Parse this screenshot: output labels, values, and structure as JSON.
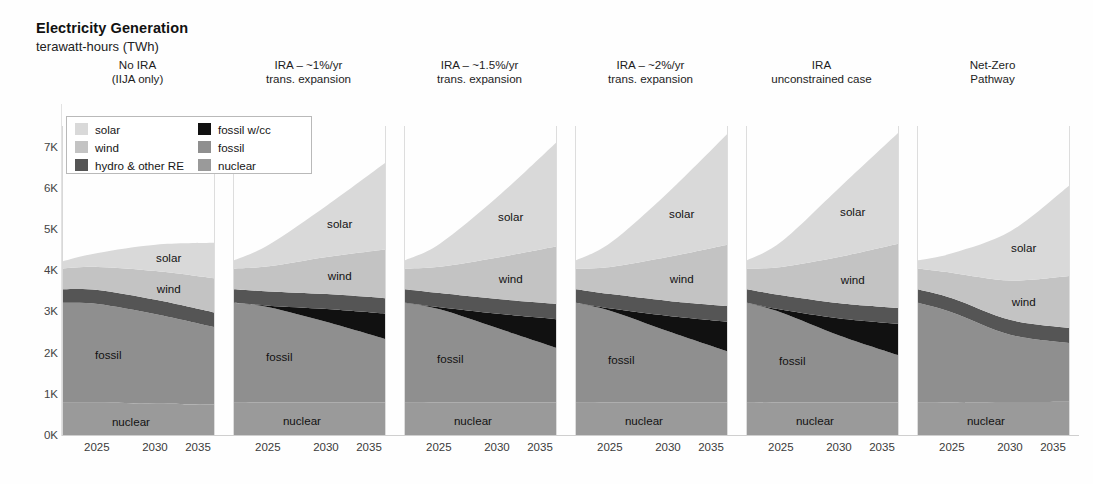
{
  "header": {
    "title": "Electricity Generation",
    "subtitle": "terawatt-hours (TWh)"
  },
  "legend": {
    "columns": [
      [
        {
          "label": "solar",
          "color": "#d9d9d9"
        },
        {
          "label": "wind",
          "color": "#c3c3c3"
        },
        {
          "label": "hydro & other RE",
          "color": "#555555"
        }
      ],
      [
        {
          "label": "fossil w/cc",
          "color": "#111111"
        },
        {
          "label": "fossil",
          "color": "#8f8f8f"
        },
        {
          "label": "nuclear",
          "color": "#9a9a9a"
        }
      ]
    ]
  },
  "axes": {
    "y_ticks": [
      "7K",
      "6K",
      "5K",
      "4K",
      "3K",
      "2K",
      "1K",
      "0K"
    ],
    "y_values": [
      7000,
      6000,
      5000,
      4000,
      3000,
      2000,
      1000,
      0
    ],
    "x_ticks": [
      "2025",
      "2030",
      "2035"
    ],
    "x_values": [
      2025,
      2030,
      2035
    ]
  },
  "chart_data": {
    "type": "area",
    "title": "Electricity Generation",
    "subtitle": "terawatt-hours (TWh)",
    "ylabel": "terawatt-hours (TWh)",
    "xlabel": "",
    "ylim": [
      0,
      7500
    ],
    "xlim": [
      2022,
      2035
    ],
    "grid": false,
    "stacked": true,
    "legend_position": "inside-top-left",
    "series_order": [
      "nuclear",
      "fossil",
      "fossil w/cc",
      "hydro & other RE",
      "wind",
      "solar"
    ],
    "series_colors": {
      "nuclear": "#9a9a9a",
      "fossil": "#8f8f8f",
      "fossil w/cc": "#111111",
      "hydro & other RE": "#555555",
      "wind": "#c3c3c3",
      "solar": "#d9d9d9"
    },
    "x": [
      2022,
      2025,
      2030,
      2035
    ],
    "panels": [
      {
        "title_lines": [
          "No IRA",
          "(IIJA only)"
        ],
        "labels_shown": [
          "solar",
          "wind",
          "fossil",
          "nuclear"
        ],
        "series": [
          {
            "name": "nuclear",
            "values": [
              780,
              780,
              760,
              740
            ]
          },
          {
            "name": "fossil",
            "values": [
              2430,
              2400,
              2170,
              1880
            ]
          },
          {
            "name": "fossil w/cc",
            "values": [
              0,
              0,
              0,
              0
            ]
          },
          {
            "name": "hydro & other RE",
            "values": [
              330,
              340,
              350,
              355
            ]
          },
          {
            "name": "wind",
            "values": [
              500,
              560,
              700,
              830
            ]
          },
          {
            "name": "solar",
            "values": [
              180,
              340,
              640,
              860
            ]
          }
        ],
        "total": [
          4220,
          4420,
          4620,
          4665
        ]
      },
      {
        "title_lines": [
          "IRA – ~1%/yr",
          "trans. expansion"
        ],
        "labels_shown": [
          "solar",
          "wind",
          "fossil",
          "nuclear"
        ],
        "series": [
          {
            "name": "nuclear",
            "values": [
              780,
              790,
              790,
              790
            ]
          },
          {
            "name": "fossil",
            "values": [
              2430,
              2310,
              1950,
              1540
            ]
          },
          {
            "name": "fossil w/cc",
            "values": [
              0,
              40,
              320,
              620
            ]
          },
          {
            "name": "hydro & other RE",
            "values": [
              330,
              345,
              360,
              370
            ]
          },
          {
            "name": "wind",
            "values": [
              500,
              610,
              900,
              1180
            ]
          },
          {
            "name": "solar",
            "values": [
              200,
              520,
              1250,
              2100
            ]
          }
        ],
        "total": [
          4240,
          4615,
          5570,
          6600
        ]
      },
      {
        "title_lines": [
          "IRA – ~1.5%/yr",
          "trans. expansion"
        ],
        "labels_shown": [
          "solar",
          "wind",
          "fossil",
          "nuclear"
        ],
        "series": [
          {
            "name": "nuclear",
            "values": [
              780,
              790,
              790,
              790
            ]
          },
          {
            "name": "fossil",
            "values": [
              2430,
              2260,
              1800,
              1330
            ]
          },
          {
            "name": "fossil w/cc",
            "values": [
              0,
              50,
              350,
              690
            ]
          },
          {
            "name": "hydro & other RE",
            "values": [
              330,
              345,
              360,
              375
            ]
          },
          {
            "name": "wind",
            "values": [
              500,
              640,
              1010,
              1390
            ]
          },
          {
            "name": "solar",
            "values": [
              200,
              560,
              1480,
              2520
            ]
          }
        ],
        "total": [
          4240,
          4645,
          5790,
          7095
        ]
      },
      {
        "title_lines": [
          "IRA – ~2%/yr",
          "trans. expansion"
        ],
        "labels_shown": [
          "solar",
          "wind",
          "fossil",
          "nuclear"
        ],
        "series": [
          {
            "name": "nuclear",
            "values": [
              780,
              790,
              790,
              790
            ]
          },
          {
            "name": "fossil",
            "values": [
              2430,
              2220,
              1720,
              1240
            ]
          },
          {
            "name": "fossil w/cc",
            "values": [
              0,
              60,
              380,
              720
            ]
          },
          {
            "name": "hydro & other RE",
            "values": [
              330,
              350,
              365,
              380
            ]
          },
          {
            "name": "wind",
            "values": [
              500,
              660,
              1070,
              1490
            ]
          },
          {
            "name": "solar",
            "values": [
              200,
              590,
              1580,
              2680
            ]
          }
        ],
        "total": [
          4240,
          4670,
          5905,
          7300
        ]
      },
      {
        "title_lines": [
          "IRA",
          "unconstrained case"
        ],
        "labels_shown": [
          "solar",
          "wind",
          "fossil",
          "nuclear"
        ],
        "series": [
          {
            "name": "nuclear",
            "values": [
              780,
              790,
              790,
              790
            ]
          },
          {
            "name": "fossil",
            "values": [
              2430,
              2180,
              1620,
              1150
            ]
          },
          {
            "name": "fossil w/cc",
            "values": [
              0,
              70,
              420,
              760
            ]
          },
          {
            "name": "hydro & other RE",
            "values": [
              330,
              350,
              365,
              380
            ]
          },
          {
            "name": "wind",
            "values": [
              500,
              690,
              1130,
              1560
            ]
          },
          {
            "name": "solar",
            "values": [
              200,
              620,
              1690,
              2690
            ]
          }
        ],
        "total": [
          4240,
          4700,
          6015,
          7330
        ]
      },
      {
        "title_lines": [
          "Net-Zero",
          "Pathway"
        ],
        "labels_shown": [
          "solar",
          "wind",
          "nuclear"
        ],
        "series": [
          {
            "name": "nuclear",
            "values": [
              780,
              790,
              800,
              810
            ]
          },
          {
            "name": "fossil",
            "values": [
              2430,
              2180,
              1630,
              1420
            ]
          },
          {
            "name": "fossil w/cc",
            "values": [
              0,
              0,
              0,
              0
            ]
          },
          {
            "name": "hydro & other RE",
            "values": [
              330,
              345,
              360,
              370
            ]
          },
          {
            "name": "wind",
            "values": [
              500,
              620,
              960,
              1260
            ]
          },
          {
            "name": "solar",
            "values": [
              200,
              480,
              1200,
              2190
            ]
          }
        ],
        "total": [
          4240,
          4415,
          4950,
          6050
        ]
      }
    ]
  }
}
